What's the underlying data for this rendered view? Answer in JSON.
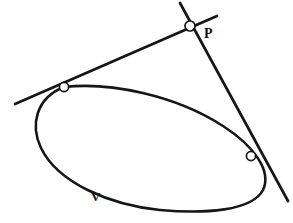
{
  "figure": {
    "type": "geometry-diagram",
    "background_color": "#ffffff",
    "ink_color": "#161616",
    "labels": [
      {
        "id": "point-p",
        "text": "P",
        "x": 204,
        "y": 38
      },
      {
        "id": "curve-v",
        "text": "V",
        "x": 91,
        "y": 201
      }
    ],
    "curve": {
      "name": "V",
      "kind": "closed-oval",
      "stroke_width": 2.6,
      "path": "M 64 87 C 110 82 175 95 223 126 C 254 146 272 171 263 190 C 252 211 205 214 160 210 C 110 205 58 183 41 148 C 30 125 36 98 64 87 Z"
    },
    "lines": [
      {
        "id": "tangent-line-left",
        "from": {
          "x": 15,
          "y": 104
        },
        "to": {
          "x": 217,
          "y": 16
        },
        "stroke_width": 2.7
      },
      {
        "id": "tangent-line-right",
        "from": {
          "x": 180,
          "y": 3
        },
        "to": {
          "x": 288,
          "y": 201
        },
        "stroke_width": 2.7
      }
    ],
    "nodes": [
      {
        "id": "external-point-p",
        "label": "P",
        "x": 190,
        "y": 26,
        "radius": 5.0
      },
      {
        "id": "tangent-point-left",
        "label": "",
        "x": 64,
        "y": 87,
        "radius": 4.6
      },
      {
        "id": "tangent-point-right",
        "label": "",
        "x": 251,
        "y": 156,
        "radius": 4.6
      }
    ]
  }
}
